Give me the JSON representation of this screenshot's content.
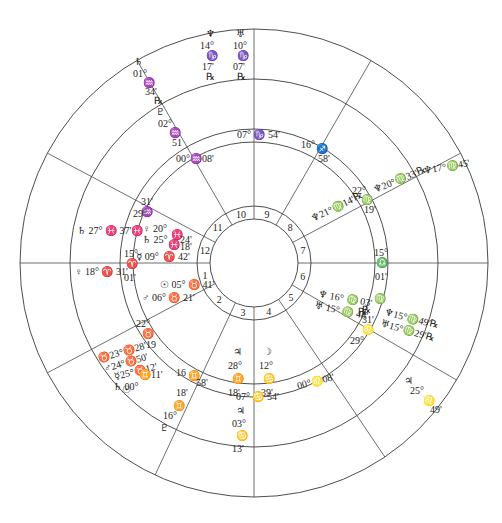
{
  "chart_title": "Natal chart wheel (tri-wheel)",
  "colors": {
    "line": "#3a3a3a",
    "text": "#222222",
    "background": "#ffffff"
  },
  "geometry": {
    "center": [
      254,
      263
    ],
    "radii": {
      "outer": 234,
      "ring2": 184,
      "ring3": 134,
      "ring4": 121,
      "ring5": 57,
      "ring6": 44
    }
  },
  "house_numbers": [
    "1",
    "2",
    "3",
    "4",
    "5",
    "6",
    "7",
    "8",
    "9",
    "10",
    "11",
    "12"
  ],
  "house_cusps": [
    {
      "house": "1",
      "label": "15° ♈ 01'"
    },
    {
      "house": "2",
      "label": "22° ♉ 19'"
    },
    {
      "house": "3",
      "label": "16° ♊ 58'"
    },
    {
      "house": "4",
      "label": "07° ♋ 54'"
    },
    {
      "house": "5",
      "label": "00° ♌ 08'"
    },
    {
      "house": "6",
      "label": "29° ♌ 31'"
    },
    {
      "house": "7",
      "label": "15° ♎ 01'"
    },
    {
      "house": "8",
      "label": "22° ♍ 19'"
    },
    {
      "house": "9",
      "label": "16° ♐ 58'"
    },
    {
      "house": "10",
      "label": "07° ♑ 54'"
    },
    {
      "house": "11",
      "label": "00° ♒ 08'"
    },
    {
      "house": "12",
      "label": "29° ♒ 31'"
    }
  ],
  "inner_planets": [
    {
      "glyph": "♀",
      "deg": "20°",
      "sign": "♓",
      "min": "24'"
    },
    {
      "glyph": "♄",
      "deg": "25°",
      "sign": "♓",
      "min": "18'"
    },
    {
      "glyph": "☿",
      "deg": "09°",
      "sign": "♈",
      "min": "42'"
    },
    {
      "glyph": "☉",
      "deg": "05°",
      "sign": "♉",
      "min": "41'"
    },
    {
      "glyph": "♂",
      "deg": "06°",
      "sign": "♉",
      "min": "21'"
    },
    {
      "glyph": "♃",
      "deg": "28°",
      "sign": "♊",
      "min": "18'"
    },
    {
      "glyph": "☽",
      "deg": "12°",
      "sign": "♋",
      "min": "39'"
    },
    {
      "glyph": "♆",
      "deg": "16°",
      "sign": "♍",
      "min": "03'",
      "retro": "℞"
    },
    {
      "glyph": "♅",
      "deg": "15°",
      "sign": "♍",
      "min": "48'",
      "retro": "℞"
    },
    {
      "glyph": "♆",
      "deg": "21°",
      "sign": "♍",
      "min": "14'",
      "retro": "℞"
    }
  ],
  "middle_planets": [
    {
      "glyph": "♄",
      "deg": "27°",
      "sign": "♓",
      "min": "37'"
    },
    {
      "glyph": "♀",
      "deg": "18°",
      "sign": "♈",
      "min": "31'"
    },
    {
      "glyph": "♉-stellium",
      "text_lines": [
        "♉23° ♉ 28'",
        "♂24° ♉ 50'",
        "☿25° ♉ 12'",
        "♄00° ♊ 11'",
        "☉"
      ]
    },
    {
      "glyph": "♃",
      "deg": "03°",
      "sign": "♋",
      "min": "13'"
    },
    {
      "glyph": "♆",
      "deg": "15°",
      "sign": "♍",
      "min": "49'",
      "retro": "℞"
    },
    {
      "glyph": "♅",
      "deg": "15°",
      "sign": "♍",
      "min": "29'",
      "retro": "℞"
    },
    {
      "glyph": "♆",
      "deg": "20°",
      "sign": "♍",
      "min": "33'",
      "retro": "℞"
    },
    {
      "glyph": "♇",
      "deg": "02°",
      "sign": "♒",
      "min": "51"
    },
    {
      "glyph": "♇",
      "deg": "16°",
      "sign": "♊",
      "min": "18'"
    }
  ],
  "outer_planets": [
    {
      "glyph": "♆",
      "deg": "14°",
      "sign": "♑",
      "min": "17'",
      "retro": "℞"
    },
    {
      "glyph": "♅",
      "deg": "10°",
      "sign": "♑",
      "min": "07'",
      "retro": "℞"
    },
    {
      "glyph": "♄",
      "deg": "01°",
      "sign": "♒",
      "min": "34'",
      "retro": "℞"
    },
    {
      "glyph": "♆",
      "deg": "17°",
      "sign": "♍",
      "min": "45'"
    },
    {
      "glyph": "♃",
      "deg": "25°",
      "sign": "♌",
      "min": "49'"
    }
  ],
  "labels": {
    "top_nep": "♆",
    "top_nep_deg": "14°",
    "top_nep_sign": "♑",
    "top_nep_min": "17'",
    "top_nep_r": "℞",
    "top_ura": "♅",
    "top_ura_deg": "10°",
    "top_ura_sign": "♑",
    "top_ura_min": "07'",
    "top_ura_r": "℞",
    "sat_outer": "♄",
    "sat_outer_deg": "01°",
    "sat_outer_sign": "♒",
    "sat_outer_min": "34'",
    "sat_outer_r": "℞",
    "plu_mid": "♇",
    "plu_mid_deg": "02°",
    "plu_mid_sign": "♒",
    "plu_mid_min": "51",
    "c11": "00°♒08'",
    "c10": "07° ♑ 54'",
    "c9_deg": "16°",
    "c9_sign": "♐",
    "c9_min": "58'",
    "c8_deg": "22°",
    "c8_sign": "♍",
    "c8_min": "19'",
    "nep_a": "♆21°♍14'℞",
    "nep_b": "♆20°♍33'℞",
    "nep_c": "♆17°♍45'",
    "c7_deg": "15°",
    "c7_sign": "♎",
    "c7_min": "01'",
    "c6_sign": "♍",
    "c6_r": "℞",
    "c6_min": "31'",
    "c6_node": "♌",
    "c6_deg": "29°",
    "nep_i": "♆ 16° ♍ 03'",
    "ura_i": "♅ 15° ♍ 48'",
    "r_i1": "℞",
    "r_i2": "℞",
    "nep_m": "♆15°♍49'℞",
    "ura_m": "♅15°♍29'℞",
    "jup_o": "♃",
    "jup_o_deg": "25°",
    "jup_o_sign": "♌",
    "jup_o_min": "49'",
    "c5": "00°♌08'",
    "moon": "☽",
    "moon_deg": "12°",
    "moon_sign": "♋",
    "moon_min": "39'",
    "jup_i": "♃",
    "jup_i_deg": "28°",
    "jup_i_sign": "♊",
    "jup_i_min": "18'",
    "c4": "07° ♋ 54'",
    "jup_m": "♃",
    "jup_m_deg": "03°",
    "jup_m_sign": "♋",
    "jup_m_min": "13'",
    "c3_deg": "16",
    "c3_sign": "♊",
    "c3_min": "58'",
    "plu2_a": "18'",
    "plu2_sign": "♊",
    "plu2_deg": "16°",
    "plu2": "♇",
    "c2_deg": "22°",
    "c2_sign": "♉",
    "c2_min": "19",
    "st1": "♉23°♉28'",
    "st2": "♂24°♉50'",
    "st3": "☿25°♉12'",
    "st3b": "♊11'",
    "st4": "♄ 00°",
    "st5": "☉",
    "sun_i": "☉ 05° ♉ 41'",
    "mars_i": "♂ 06° ♉ 21'",
    "c1_deg": "15°",
    "c1_sign": "♈",
    "c1_min": "01'",
    "ven_m": "♀ 18° ♈ 31'",
    "sat_m": "♄ 27° ♓ 37'",
    "c12_deg": "29°",
    "c12_min": "31'",
    "c12_sign": "♒",
    "c12b": "♓",
    "ven_i": "♀ 20°",
    "ven_i_sign": "♓",
    "ven_i_min": "24'",
    "sat_i": "♄ 25°",
    "sat_i_sign": "♓",
    "sat_i_min": "18'",
    "mer_i": "☿ 09°",
    "mer_i_sign": "♈",
    "mer_i_min": "42'"
  }
}
